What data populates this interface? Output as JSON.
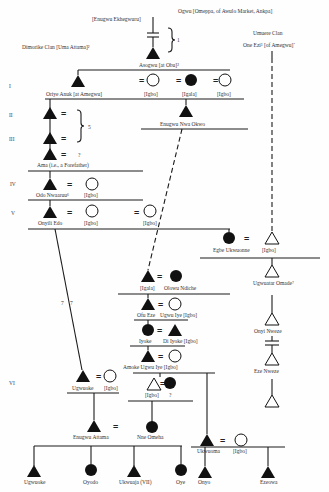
{
  "labels": {
    "ogwu": "Ogwu [Omeppa, of Awulo Market, Ankpa]",
    "enugwu_ekhegwuru": "[Enugwu Ekhegwuru]",
    "bracket1_note": "1",
    "dimorike_clan": "Dimorike Clan [Uma Attama]²",
    "umuere_clan": "Umuere Clan",
    "one_ezi": "One Ezi³ [of Amegwu]´",
    "asogwu": "Asogwu [at Obu]²",
    "oriye_anuk": "Oriye Anuk [at Amegwu]",
    "igbo": "[Igbo]",
    "igala": "[Igala]",
    "enugwu_nwa_okwo": "Enugwu Nwa Okwo",
    "bracket2_note": "5",
    "ama": "Ama (i.e., a Forefather)",
    "ama_note": "?",
    "odo_nwaaruu": "Odo Nwaaruu⁶",
    "onyili_edo": "Onyili Edo",
    "egbe_ukwuonne": "Egbe Ukwuonne",
    "olowu_ndiche": "Olowu Ndiche",
    "ugwuatar_omade": "Ugwuatar Omade⁷",
    "ofu_eze": "Ofu Eze",
    "ugwu_iye_igbo": "Ugwu Iye [Igbo]",
    "iyoke": "Iyoke",
    "di_iyoke_igbo": "Di Iyoke [Igbo]",
    "onyi_nweze": "Onyi Nweze",
    "amoke_ugwu_iye_igbo": "Amoke Ugwu Iye [Igbo]",
    "eze_nweze": "Eze Nweze",
    "ugwuoke": "Ugwuoke",
    "seven_note": "7",
    "q_note": "?",
    "enugwu_attama": "Enugwu Attama",
    "nne_omeha": "Nne Omeha",
    "ukwuoma": "Ukwuoma",
    "child_ugwuoke": "Ugwuoke",
    "oyodo": "Oyodo",
    "ukwuaja": "Ukwuaja (VII)",
    "oye": "Oye",
    "onyo": "Onyo",
    "ezeowa": "Ezeowa"
  },
  "generations": [
    "I",
    "II",
    "III",
    "IV",
    "V",
    "VI"
  ],
  "symbols": {
    "equals": "="
  },
  "legend": {
    "filled_triangle": "male",
    "filled_circle": "female",
    "open_triangle": "male (other lineage)",
    "open_circle": "female (other lineage)"
  }
}
